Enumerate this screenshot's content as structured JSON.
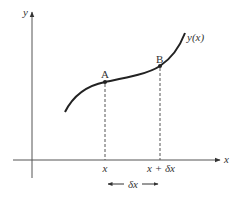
{
  "diagram": {
    "axes": {
      "x_label": "x",
      "y_label": "y"
    },
    "curve": {
      "label": "y(x)"
    },
    "points": [
      {
        "name": "A",
        "label": "A"
      },
      {
        "name": "B",
        "label": "B"
      }
    ],
    "ticks": [
      {
        "label": "x"
      },
      {
        "label": "x + δx"
      }
    ],
    "interval": {
      "label": "δx"
    },
    "colors": {
      "line": "#333333",
      "dashed": "#555555"
    }
  }
}
